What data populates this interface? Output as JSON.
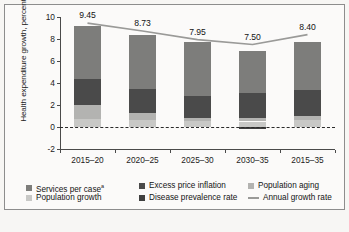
{
  "chart_data": {
    "type": "bar",
    "subtype": "stacked-bar-with-line",
    "title": "",
    "xlabel": "",
    "ylabel": "Health expenditure growth, percent",
    "ylim": [
      -2,
      10
    ],
    "yticks": [
      -2,
      0,
      2,
      4,
      6,
      8,
      10
    ],
    "ytick_labels": [
      "-2",
      "0",
      "2",
      "4",
      "6",
      "8",
      "10"
    ],
    "grid": false,
    "legend_position": "bottom",
    "categories": [
      "2015–20",
      "2020–25",
      "2025–30",
      "2030–35",
      "2015–35"
    ],
    "series": [
      {
        "name": "Population growth",
        "color": "#c8c8c6",
        "values": [
          0.75,
          0.65,
          0.55,
          0.5,
          0.6
        ]
      },
      {
        "name": "Population aging",
        "color": "#b3b3b1",
        "values": [
          1.25,
          0.65,
          0.3,
          0.35,
          0.4
        ]
      },
      {
        "name": "Disease prevalence rate",
        "color": "#3f3f3f",
        "values": [
          0.0,
          0.0,
          0.0,
          -0.15,
          0.0
        ]
      },
      {
        "name": "Excess price inflation",
        "color": "#4a4a4a",
        "values": [
          2.4,
          2.15,
          1.95,
          2.25,
          2.4
        ]
      },
      {
        "name": "Services per case",
        "color": "#7d7d7b",
        "values": [
          4.8,
          4.9,
          4.95,
          3.85,
          4.3
        ]
      }
    ],
    "line_series": {
      "name": "Annual growth rate",
      "color": "#9a9a98",
      "values": [
        9.45,
        8.73,
        7.95,
        7.5,
        8.4
      ]
    },
    "bar_value_labels": [
      "9.45",
      "8.73",
      "7.95",
      "7.50",
      "8.40"
    ]
  },
  "axis": {
    "y_title": "Health expenditure growth, percent",
    "y_tick_labels": [
      "10",
      "8",
      "6",
      "4",
      "2",
      "0",
      "-2"
    ],
    "x_tick_labels": [
      "2015–20",
      "2020–25",
      "2025–30",
      "2030–35",
      "2015–35"
    ]
  },
  "values": {
    "bar_1": "9.45",
    "bar_2": "8.73",
    "bar_3": "7.95",
    "bar_4": "7.50",
    "bar_5": "8.40"
  },
  "legend": {
    "row1": [
      {
        "label": "Services per case",
        "superscript": "a",
        "color": "#7d7d7b",
        "type": "swatch"
      },
      {
        "label": "Excess price inflation",
        "superscript": "",
        "color": "#4a4a4a",
        "type": "swatch"
      },
      {
        "label": "Population aging",
        "superscript": "",
        "color": "#b3b3b1",
        "type": "swatch"
      }
    ],
    "row2": [
      {
        "label": "Population growth",
        "superscript": "",
        "color": "#c8c8c6",
        "type": "swatch"
      },
      {
        "label": "Disease prevalence rate",
        "superscript": "",
        "color": "#3f3f3f",
        "type": "swatch"
      },
      {
        "label": "Annual growth rate",
        "superscript": "",
        "color": "#9a9a98",
        "type": "line"
      }
    ]
  },
  "colors": {
    "services_per_case": "#7d7d7b",
    "excess_price_inflation": "#4a4a4a",
    "population_aging": "#b3b3b1",
    "population_growth": "#c8c8c6",
    "disease_prevalence_rate": "#3f3f3f",
    "annual_growth_rate": "#9a9a98",
    "axis": "#4a4a4a",
    "text": "#141414",
    "background": "#fbfaf9"
  }
}
